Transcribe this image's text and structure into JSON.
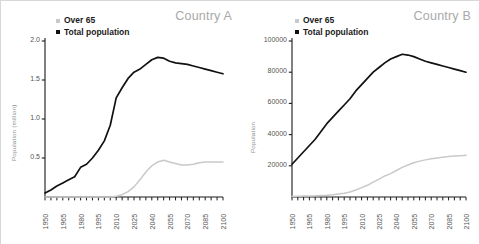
{
  "figure": {
    "background": "#ffffff",
    "width": 479,
    "height": 244
  },
  "legend": {
    "over65_label": "Over 65",
    "total_label": "Total population",
    "over65_color": "#c9c9c9",
    "total_color": "#111111",
    "position": "top-left inside axes"
  },
  "panels": [
    {
      "id": "a",
      "title": "Country A"
    },
    {
      "id": "b",
      "title": "Country B"
    }
  ],
  "chart_data": [
    {
      "type": "line",
      "title": "Country A",
      "xlabel": "",
      "ylabel": "Population (million)",
      "xlim": [
        1950,
        2100
      ],
      "ylim": [
        0,
        2.0
      ],
      "grid": false,
      "legend_position": "top-left",
      "xticks": [
        1950,
        1965,
        1980,
        1995,
        2010,
        2025,
        2040,
        2055,
        2070,
        2085,
        2100
      ],
      "yticks": [
        0.5,
        1.0,
        1.5,
        2.0
      ],
      "minor_xtick_step": 5,
      "x": [
        1950,
        1955,
        1960,
        1965,
        1970,
        1975,
        1980,
        1985,
        1990,
        1995,
        2000,
        2005,
        2010,
        2015,
        2020,
        2025,
        2030,
        2035,
        2040,
        2045,
        2050,
        2055,
        2060,
        2065,
        2070,
        2075,
        2080,
        2085,
        2090,
        2095,
        2100
      ],
      "series": [
        {
          "name": "Total population",
          "color": "#111111",
          "values": [
            0.05,
            0.09,
            0.14,
            0.18,
            0.22,
            0.26,
            0.38,
            0.42,
            0.5,
            0.6,
            0.72,
            0.92,
            1.27,
            1.4,
            1.52,
            1.6,
            1.64,
            1.7,
            1.76,
            1.79,
            1.78,
            1.74,
            1.72,
            1.71,
            1.7,
            1.68,
            1.66,
            1.64,
            1.62,
            1.6,
            1.58
          ]
        },
        {
          "name": "Over 65",
          "color": "#c9c9c9",
          "values": [
            0.0,
            0.0,
            0.0,
            0.0,
            0.0,
            0.0,
            0.0,
            0.0,
            0.0,
            0.0,
            0.0,
            0.0,
            0.01,
            0.03,
            0.07,
            0.13,
            0.22,
            0.32,
            0.4,
            0.45,
            0.47,
            0.45,
            0.43,
            0.41,
            0.41,
            0.42,
            0.44,
            0.45,
            0.45,
            0.45,
            0.45
          ]
        }
      ]
    },
    {
      "type": "line",
      "title": "Country B",
      "xlabel": "",
      "ylabel": "Population",
      "xlim": [
        1950,
        2100
      ],
      "ylim": [
        0,
        100000
      ],
      "grid": false,
      "legend_position": "top-left",
      "xticks": [
        1950,
        1965,
        1980,
        1995,
        2010,
        2025,
        2040,
        2055,
        2070,
        2085,
        2100
      ],
      "yticks": [
        20000,
        40000,
        60000,
        80000,
        100000
      ],
      "minor_xtick_step": 5,
      "x": [
        1950,
        1955,
        1960,
        1965,
        1970,
        1975,
        1980,
        1985,
        1990,
        1995,
        2000,
        2005,
        2010,
        2015,
        2020,
        2025,
        2030,
        2035,
        2040,
        2045,
        2050,
        2055,
        2060,
        2065,
        2070,
        2075,
        2080,
        2085,
        2090,
        2095,
        2100
      ],
      "series": [
        {
          "name": "Total population",
          "color": "#111111",
          "values": [
            21000,
            25000,
            29000,
            33000,
            37000,
            42000,
            47000,
            51000,
            55000,
            59000,
            63000,
            68000,
            72000,
            76000,
            80000,
            83000,
            86000,
            88500,
            90000,
            91500,
            91000,
            90000,
            88500,
            87000,
            86000,
            85000,
            84000,
            83000,
            82000,
            81000,
            80000
          ]
        },
        {
          "name": "Over 65",
          "color": "#c9c9c9",
          "values": [
            400,
            500,
            600,
            700,
            800,
            1000,
            1200,
            1500,
            1900,
            2400,
            3200,
            4500,
            6000,
            7500,
            9500,
            11500,
            13500,
            15000,
            17000,
            19000,
            20500,
            22000,
            23000,
            23800,
            24500,
            25000,
            25500,
            26000,
            26300,
            26500,
            26700
          ]
        }
      ]
    }
  ]
}
